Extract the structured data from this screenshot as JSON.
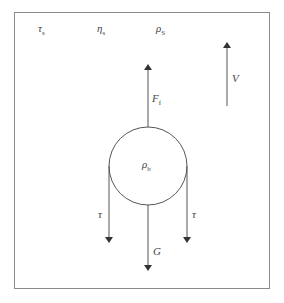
{
  "diagram": {
    "top_labels": [
      {
        "symbol": "τ",
        "sub": "s"
      },
      {
        "symbol": "η",
        "sub": "s"
      },
      {
        "symbol": "ρ",
        "sub": "S"
      }
    ],
    "particle_label": {
      "symbol": "ρ",
      "sub": "b"
    },
    "forces": {
      "buoyancy": {
        "symbol": "F",
        "sub": "f"
      },
      "gravity": {
        "symbol": "G",
        "sub": ""
      },
      "shear_left": {
        "symbol": "τ",
        "sub": ""
      },
      "shear_right": {
        "symbol": "τ",
        "sub": ""
      },
      "velocity": {
        "symbol": "V",
        "sub": ""
      }
    },
    "colors": {
      "line": "#555555",
      "frame": "#8a8a8a"
    }
  }
}
